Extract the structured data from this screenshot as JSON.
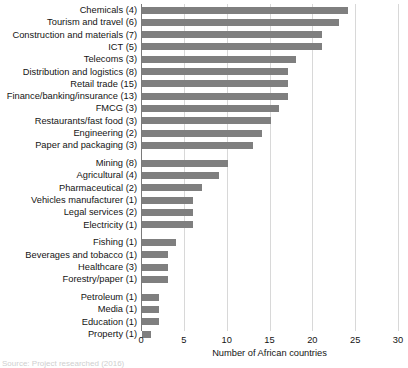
{
  "chart_data": {
    "type": "bar",
    "orientation": "horizontal",
    "title": "",
    "xlabel": "Number of African countries",
    "ylabel": "",
    "xlim": [
      0,
      30
    ],
    "xticks": [
      0,
      5,
      10,
      15,
      20,
      25,
      30
    ],
    "grid": true,
    "legend": null,
    "bar_color": "#7f7f7f",
    "categories": [
      "Chemicals (4)",
      "Tourism and travel (6)",
      "Construction and materials (7)",
      "ICT (5)",
      "Telecoms (3)",
      "Distribution and logistics (8)",
      "Retail trade (15)",
      "Finance/banking/insurance (13)",
      "FMCG (3)",
      "Restaurants/fast food (3)",
      "Engineering (2)",
      "Paper and packaging (3)",
      "Mining (8)",
      "Agricultural (4)",
      "Pharmaceutical (2)",
      "Vehicles manufacturer (1)",
      "Legal services (2)",
      "Electricity (1)",
      "Fishing (1)",
      "Beverages and tobacco (1)",
      "Healthcare (3)",
      "Forestry/paper (1)",
      "Petroleum (1)",
      "Media (1)",
      "Education (1)",
      "Property (1)"
    ],
    "values": [
      24,
      23,
      21,
      21,
      18,
      17,
      17,
      17,
      16,
      15,
      14,
      13,
      10,
      9,
      7,
      6,
      6,
      6,
      4,
      3,
      3,
      3,
      2,
      2,
      2,
      1
    ],
    "group_breaks_after": [
      11,
      17,
      21
    ]
  },
  "footer": {
    "source_note": "Source: Project researched (2016)"
  }
}
